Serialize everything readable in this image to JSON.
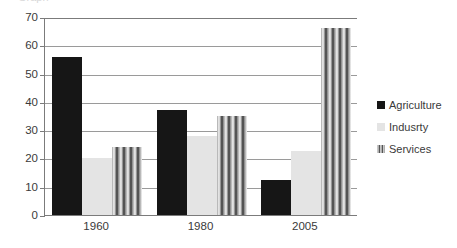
{
  "title_strip": {
    "clipped_text": "Graph"
  },
  "chart_data": {
    "type": "bar",
    "title": "",
    "xlabel": "",
    "ylabel": "",
    "categories": [
      "1960",
      "1980",
      "2005"
    ],
    "series": [
      {
        "name": "Agriculture",
        "color": "#161616",
        "fill": "solid",
        "values": [
          56,
          37,
          12.5
        ]
      },
      {
        "name": "Indusrty",
        "color": "#e4e4e4",
        "fill": "solid",
        "values": [
          20,
          28,
          22.5
        ]
      },
      {
        "name": "Services",
        "color": "#9d9d9d",
        "fill": "vertical-stripes",
        "values": [
          24,
          35,
          66
        ]
      }
    ],
    "ylim": [
      0,
      70
    ],
    "yticks": [
      0,
      10,
      20,
      30,
      40,
      50,
      60,
      70
    ],
    "ytick_labels": [
      "0",
      "10",
      "20",
      "30",
      "40",
      "50",
      "60",
      "70"
    ],
    "grid": true,
    "grid_orientation": "horizontal",
    "legend_position": "right"
  },
  "legend": {
    "items": [
      {
        "label": "Agriculture"
      },
      {
        "label": "Indusrty"
      },
      {
        "label": "Services"
      }
    ]
  }
}
